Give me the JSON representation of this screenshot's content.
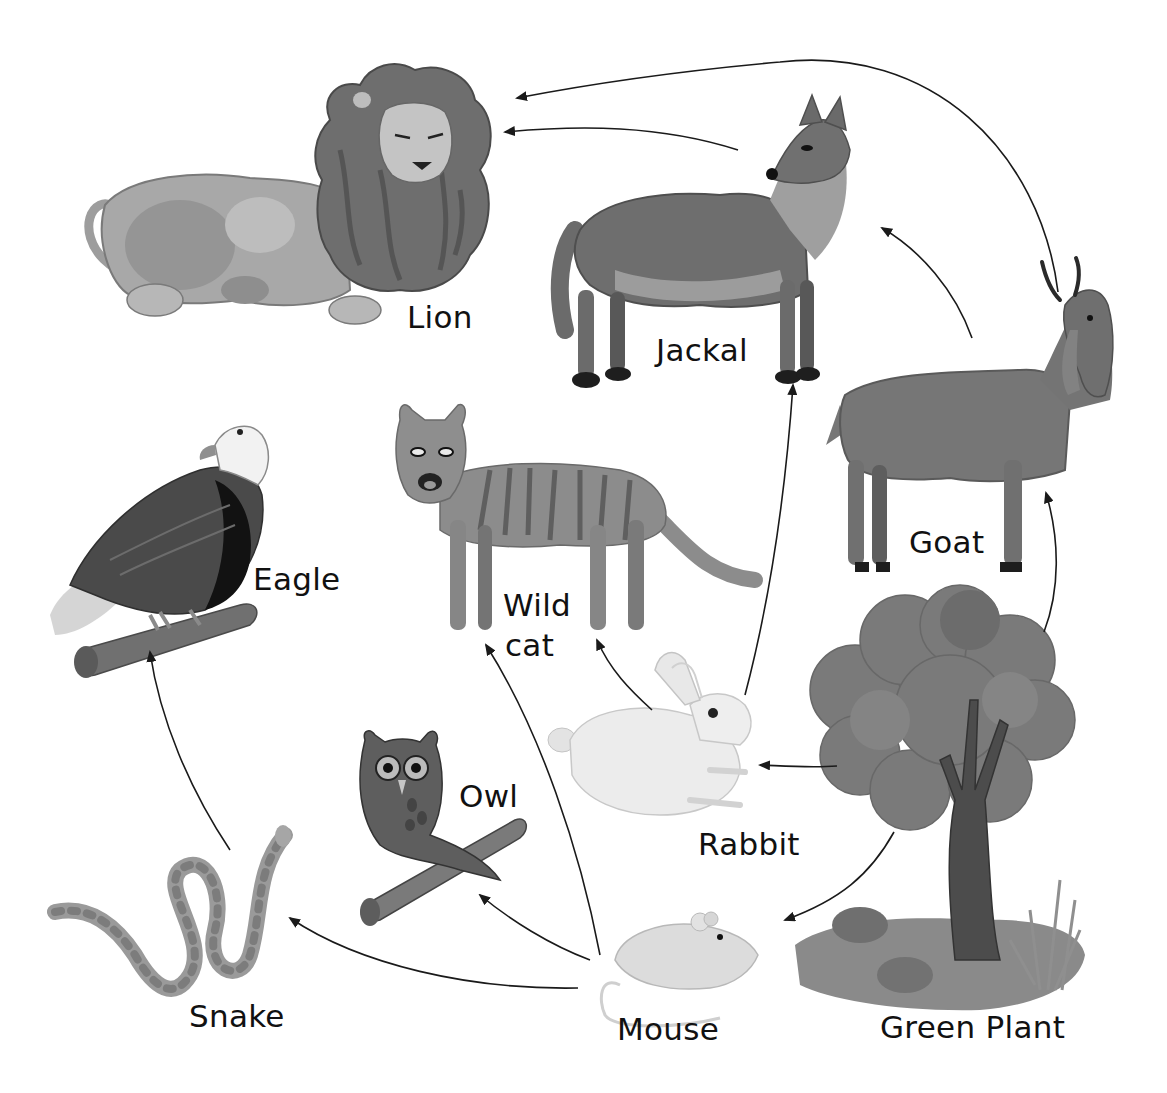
{
  "diagram": {
    "type": "food-web",
    "background": "#ffffff",
    "arrow_color": "#1a1a1a",
    "organisms": [
      {
        "id": "lion",
        "label": "Lion",
        "icon": "lion-icon"
      },
      {
        "id": "jackal",
        "label": "Jackal",
        "icon": "jackal-icon"
      },
      {
        "id": "goat",
        "label": "Goat",
        "icon": "goat-icon"
      },
      {
        "id": "eagle",
        "label": "Eagle",
        "icon": "eagle-icon"
      },
      {
        "id": "wildcat",
        "label_line1": "Wild",
        "label_line2": "cat",
        "icon": "wild-cat-icon"
      },
      {
        "id": "owl",
        "label": "Owl",
        "icon": "owl-icon"
      },
      {
        "id": "rabbit",
        "label": "Rabbit",
        "icon": "rabbit-icon"
      },
      {
        "id": "snake",
        "label": "Snake",
        "icon": "snake-icon"
      },
      {
        "id": "mouse",
        "label": "Mouse",
        "icon": "mouse-icon"
      },
      {
        "id": "plant",
        "label": "Green Plant",
        "icon": "tree-icon"
      }
    ],
    "edges": [
      {
        "from": "Green Plant",
        "to": "Goat"
      },
      {
        "from": "Green Plant",
        "to": "Rabbit"
      },
      {
        "from": "Green Plant",
        "to": "Mouse"
      },
      {
        "from": "Goat",
        "to": "Jackal"
      },
      {
        "from": "Goat",
        "to": "Lion"
      },
      {
        "from": "Jackal",
        "to": "Lion"
      },
      {
        "from": "Rabbit",
        "to": "Jackal"
      },
      {
        "from": "Rabbit",
        "to": "Wild cat"
      },
      {
        "from": "Mouse",
        "to": "Wild cat"
      },
      {
        "from": "Mouse",
        "to": "Owl"
      },
      {
        "from": "Mouse",
        "to": "Snake"
      },
      {
        "from": "Snake",
        "to": "Eagle"
      }
    ]
  },
  "labels": {
    "lion": "Lion",
    "jackal": "Jackal",
    "goat": "Goat",
    "eagle": "Eagle",
    "wildcat_1": "Wild",
    "wildcat_2": "cat",
    "owl": "Owl",
    "rabbit": "Rabbit",
    "snake": "Snake",
    "mouse": "Mouse",
    "plant": "Green Plant"
  }
}
